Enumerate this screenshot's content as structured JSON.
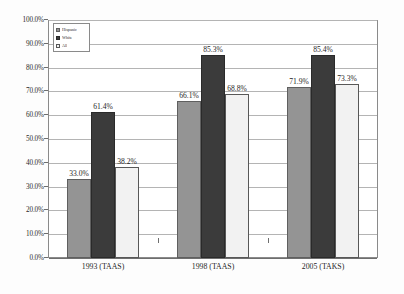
{
  "chart_data": {
    "type": "bar",
    "title": "",
    "subtitle": "",
    "xlabel": "",
    "ylabel": "",
    "ylim": [
      0,
      100
    ],
    "grid": true,
    "legend_position": "top-left-inside",
    "value_label_format": "percent-one-decimal",
    "categories": [
      "1993 (TAAS)",
      "1998 (TAAS)",
      "2005 (TAKS)"
    ],
    "y_ticks": [
      "0.0%",
      "10.0%",
      "20.0%",
      "30.0%",
      "40.0%",
      "50.0%",
      "60.0%",
      "70.0%",
      "80.0%",
      "90.0%",
      "100.0%"
    ],
    "series": [
      {
        "name": "Hispanic",
        "color": "#949494",
        "values": [
          33.0,
          66.1,
          71.9
        ],
        "labels": [
          "33.0%",
          "66.1%",
          "71.9%"
        ]
      },
      {
        "name": "White",
        "color": "#3b3b3b",
        "values": [
          61.4,
          85.3,
          85.4
        ],
        "labels": [
          "61.4%",
          "85.3%",
          "85.4%"
        ]
      },
      {
        "name": "All",
        "color": "#f2f2f2",
        "values": [
          38.2,
          68.8,
          73.3
        ],
        "labels": [
          "38.2%",
          "68.8%",
          "73.3%"
        ]
      }
    ]
  },
  "legend": {
    "items": [
      {
        "label": "Hispanic"
      },
      {
        "label": "White"
      },
      {
        "label": "All"
      }
    ]
  },
  "axis": {
    "y": {
      "ticks": [
        {
          "label": "100.0%"
        },
        {
          "label": "90.0%"
        },
        {
          "label": "80.0%"
        },
        {
          "label": "70.0%"
        },
        {
          "label": "60.0%"
        },
        {
          "label": "50.0%"
        },
        {
          "label": "40.0%"
        },
        {
          "label": "30.0%"
        },
        {
          "label": "20.0%"
        },
        {
          "label": "10.0%"
        },
        {
          "label": "0.0%"
        }
      ]
    },
    "x": {
      "categories": [
        {
          "label": "1993 (TAAS)"
        },
        {
          "label": "1998 (TAAS)"
        },
        {
          "label": "2005 (TAKS)"
        }
      ]
    }
  }
}
